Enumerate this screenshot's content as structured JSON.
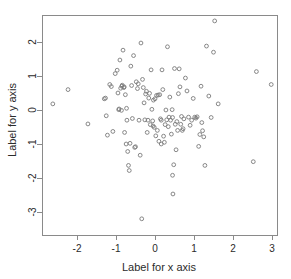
{
  "chart_data": {
    "type": "scatter",
    "title": "",
    "xlabel": "Label for x axis",
    "ylabel": "Label for y axis",
    "xticks": [
      -2,
      -1,
      0,
      1,
      2,
      3
    ],
    "yticks": [
      2,
      1,
      0,
      -1,
      -2,
      -3
    ],
    "xticklabels": [
      "-2",
      "-1",
      "0",
      "1",
      "2",
      "3"
    ],
    "yticklabels": [
      "2",
      "1",
      "0",
      "-1",
      "-2",
      "-3"
    ],
    "xlim": [
      -2.95,
      3.3
    ],
    "ylim": [
      -3.45,
      2.8
    ],
    "grid": false,
    "legend": null,
    "marker": "open-circle",
    "marker_color": "#7a7a7a",
    "n_points": 126,
    "points": [
      [
        -2.62,
        0.18
      ],
      [
        -2.23,
        0.6
      ],
      [
        -1.72,
        -0.41
      ],
      [
        -1.27,
        0.35
      ],
      [
        -1.25,
        -0.17
      ],
      [
        -1.22,
        -0.74
      ],
      [
        -1.16,
        0.75
      ],
      [
        -1.12,
        0.69
      ],
      [
        -1.08,
        -0.63
      ],
      [
        -1.02,
        1.07
      ],
      [
        -0.97,
        1.17
      ],
      [
        -0.95,
        0.5
      ],
      [
        -0.93,
        0.01
      ],
      [
        -0.92,
        0.03
      ],
      [
        -0.9,
        1.47
      ],
      [
        -0.88,
        0.64
      ],
      [
        -0.86,
        -0.01
      ],
      [
        -0.85,
        0.7
      ],
      [
        -0.84,
        0.73
      ],
      [
        -0.82,
        1.76
      ],
      [
        -0.8,
        0.66
      ],
      [
        -0.79,
        0.68
      ],
      [
        -0.78,
        -0.66
      ],
      [
        -0.76,
        0.45
      ],
      [
        -0.74,
        -1.0
      ],
      [
        -0.73,
        0.05
      ],
      [
        -0.72,
        -0.3
      ],
      [
        -0.7,
        -1.22
      ],
      [
        -0.68,
        -1.63
      ],
      [
        -0.66,
        -1.78
      ],
      [
        -0.64,
        -0.98
      ],
      [
        -0.62,
        1.29
      ],
      [
        -0.6,
        0.72
      ],
      [
        -0.58,
        -0.25
      ],
      [
        -0.55,
        1.6
      ],
      [
        -0.52,
        -1.1
      ],
      [
        -0.5,
        -1.08
      ],
      [
        -0.48,
        0.83
      ],
      [
        -0.45,
        0.63
      ],
      [
        -0.43,
        0.77
      ],
      [
        -0.41,
        -0.3
      ],
      [
        -0.38,
        -1.33
      ],
      [
        -0.36,
        1.97
      ],
      [
        -0.34,
        -3.2
      ],
      [
        -0.32,
        0.9
      ],
      [
        -0.3,
        0.66
      ],
      [
        -0.28,
        0.21
      ],
      [
        -0.26,
        -0.29
      ],
      [
        -0.24,
        0.47
      ],
      [
        -0.22,
        0.55
      ],
      [
        -0.2,
        -0.66
      ],
      [
        -0.18,
        -0.3
      ],
      [
        -0.16,
        0.35
      ],
      [
        -0.14,
        0.49
      ],
      [
        -0.12,
        -0.43
      ],
      [
        -0.1,
        1.18
      ],
      [
        -0.08,
        0.02
      ],
      [
        -0.06,
        -0.32
      ],
      [
        -0.05,
        -0.47
      ],
      [
        -0.04,
        0.29
      ],
      [
        -0.02,
        -0.51
      ],
      [
        0.0,
        0.33
      ],
      [
        0.02,
        -0.76
      ],
      [
        0.04,
        0.43
      ],
      [
        0.06,
        -0.6
      ],
      [
        0.08,
        0.44
      ],
      [
        0.1,
        -0.92
      ],
      [
        0.12,
        0.45
      ],
      [
        0.14,
        -0.26
      ],
      [
        0.16,
        -0.3
      ],
      [
        0.18,
        1.18
      ],
      [
        0.2,
        0.6
      ],
      [
        0.22,
        -0.77
      ],
      [
        0.24,
        -0.95
      ],
      [
        0.26,
        -0.43
      ],
      [
        0.28,
        0.0
      ],
      [
        0.3,
        -0.29
      ],
      [
        0.32,
        1.86
      ],
      [
        0.34,
        -0.49
      ],
      [
        0.36,
        -0.21
      ],
      [
        0.38,
        0.38
      ],
      [
        0.4,
        -0.3
      ],
      [
        0.42,
        -0.71
      ],
      [
        0.44,
        0.01
      ],
      [
        0.45,
        -1.92
      ],
      [
        0.46,
        -2.47
      ],
      [
        0.48,
        -1.61
      ],
      [
        0.5,
        1.22
      ],
      [
        0.52,
        -0.42
      ],
      [
        0.54,
        -1.17
      ],
      [
        0.56,
        -0.34
      ],
      [
        0.58,
        -0.6
      ],
      [
        0.6,
        0.48
      ],
      [
        0.62,
        1.21
      ],
      [
        0.64,
        0.68
      ],
      [
        0.66,
        -0.42
      ],
      [
        0.68,
        -0.19
      ],
      [
        0.7,
        -0.6
      ],
      [
        0.72,
        -0.55
      ],
      [
        0.74,
        -0.26
      ],
      [
        0.78,
        0.94
      ],
      [
        0.82,
        0.56
      ],
      [
        0.86,
        -0.21
      ],
      [
        0.9,
        -0.45
      ],
      [
        0.94,
        -0.3
      ],
      [
        0.98,
        0.34
      ],
      [
        1.02,
        -0.21
      ],
      [
        1.05,
        -0.24
      ],
      [
        1.08,
        -0.2
      ],
      [
        1.12,
        -1.07
      ],
      [
        1.15,
        -0.72
      ],
      [
        1.18,
        0.7
      ],
      [
        1.2,
        -0.37
      ],
      [
        1.22,
        -0.61
      ],
      [
        1.25,
        -0.79
      ],
      [
        1.28,
        -1.63
      ],
      [
        1.32,
        1.88
      ],
      [
        1.38,
        0.41
      ],
      [
        1.44,
        -0.22
      ],
      [
        1.5,
        1.7
      ],
      [
        1.53,
        2.62
      ],
      [
        1.62,
        0.18
      ],
      [
        2.52,
        -1.52
      ],
      [
        2.6,
        1.13
      ],
      [
        2.98,
        0.75
      ],
      [
        -1.3,
        0.33
      ],
      [
        0.45,
        -0.22
      ],
      [
        0.16,
        -1.0
      ]
    ]
  },
  "layout": {
    "plot_left": 42,
    "plot_right": 277,
    "plot_top": 15,
    "plot_bottom": 235,
    "x_zero_px": 155,
    "y_zero_px": 110,
    "x_unit_px": 39,
    "y_unit_px": 34
  },
  "colors": {
    "background": "#ffffff",
    "frame": "#8a8a8a",
    "text": "#2b2b2b",
    "point": "#7a7a7a"
  }
}
